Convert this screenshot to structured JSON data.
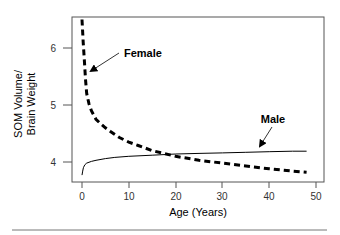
{
  "chart_data": {
    "type": "line",
    "title": "",
    "xlabel": "Age (Years)",
    "ylabel": [
      "SOM Volume/",
      "Brain Weight"
    ],
    "xlim": [
      0,
      50
    ],
    "ylim": [
      3.65,
      6.55
    ],
    "xticks": [
      0,
      10,
      20,
      30,
      40,
      50
    ],
    "yticks": [
      4,
      5,
      6
    ],
    "grid": false,
    "legend": "inline annotations with arrows",
    "series": [
      {
        "name": "Female",
        "style": "dashed-thick",
        "x": [
          0,
          0.25,
          0.5,
          0.75,
          1,
          1.5,
          2,
          3,
          4,
          5,
          6,
          8,
          10,
          12,
          15,
          20,
          25,
          30,
          35,
          40,
          45,
          48
        ],
        "values": [
          6.5,
          6.1,
          5.8,
          5.45,
          5.2,
          5.02,
          4.9,
          4.75,
          4.67,
          4.6,
          4.54,
          4.43,
          4.35,
          4.29,
          4.2,
          4.1,
          4.03,
          3.98,
          3.93,
          3.88,
          3.84,
          3.82
        ]
      },
      {
        "name": "Male",
        "style": "solid-thin",
        "x": [
          0,
          0.15,
          0.3,
          0.6,
          1,
          2,
          3,
          5,
          7,
          10,
          15,
          20,
          25,
          30,
          35,
          40,
          45,
          48
        ],
        "values": [
          3.77,
          3.84,
          3.9,
          3.95,
          3.98,
          4.01,
          4.03,
          4.06,
          4.08,
          4.1,
          4.12,
          4.14,
          4.15,
          4.16,
          4.17,
          4.18,
          4.19,
          4.19
        ]
      }
    ],
    "annotations": [
      {
        "text": "Female",
        "label_pos": [
          9,
          6.05
        ],
        "arrow_to": [
          0.8,
          5.6
        ]
      },
      {
        "text": "Male",
        "label_pos": [
          41,
          4.75
        ],
        "arrow_to": [
          38,
          4.28
        ]
      }
    ]
  },
  "labels": {
    "xlabel": "Age (Years)",
    "ylabel_line1": "SOM Volume/",
    "ylabel_line2": "Brain Weight",
    "female": "Female",
    "male": "Male",
    "xtick_0": "0",
    "xtick_1": "10",
    "xtick_2": "20",
    "xtick_3": "30",
    "xtick_4": "40",
    "xtick_5": "50",
    "ytick_0": "4",
    "ytick_1": "5",
    "ytick_2": "6"
  },
  "colors": {
    "line": "#000000",
    "axis": "#555555",
    "text": "#333333",
    "separator": "#777777"
  }
}
